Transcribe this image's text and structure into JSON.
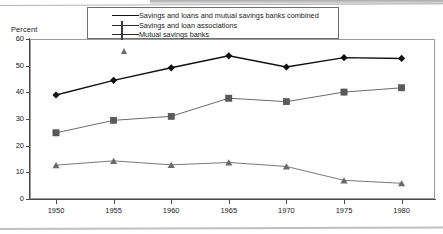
{
  "chart_data": {
    "type": "line",
    "title": "",
    "subtitle": "",
    "xlabel": "",
    "ylabel": "Percent",
    "categories": [
      "1950",
      "1955",
      "1960",
      "1965",
      "1970",
      "1975",
      "1980"
    ],
    "x": [
      1950,
      1955,
      1960,
      1965,
      1970,
      1975,
      1980
    ],
    "xlim": [
      1948,
      1982
    ],
    "ylim": [
      0,
      60
    ],
    "ytick_labels": [
      "0",
      "10",
      "20",
      "30",
      "40",
      "50",
      "60"
    ],
    "ytick_values": [
      0,
      10,
      20,
      30,
      40,
      50,
      60
    ],
    "grid": false,
    "legend_position": "top",
    "series": [
      {
        "name": "Savings and loans and mutual savings banks combined",
        "marker": "diamond",
        "color": "#111111",
        "values": [
          39.0,
          44.5,
          49.2,
          53.7,
          49.5,
          53.0,
          52.7
        ]
      },
      {
        "name": "Savings and loan associations",
        "marker": "square",
        "color": "#5a5a5a",
        "values": [
          24.8,
          29.5,
          31.0,
          37.8,
          36.5,
          40.1,
          41.7
        ]
      },
      {
        "name": "Mutual savings banks",
        "marker": "triangle",
        "color": "#6a6a6a",
        "values": [
          12.7,
          14.3,
          12.8,
          13.7,
          12.2,
          7.0,
          5.9
        ]
      }
    ]
  },
  "axes": {
    "y_axis_caption": "Percent",
    "y_ticks": [
      "60",
      "50",
      "40",
      "30",
      "20",
      "10",
      "0"
    ],
    "x_ticks": [
      "1950",
      "1955",
      "1960",
      "1965",
      "1970",
      "1975",
      "1980"
    ]
  },
  "legend": {
    "items": [
      {
        "label": "Savings and loans and mutual savings banks combined",
        "marker": "diamond"
      },
      {
        "label": "Savings and loan associations",
        "marker": "square"
      },
      {
        "label": "Mutual savings banks",
        "marker": "triangle"
      }
    ]
  }
}
